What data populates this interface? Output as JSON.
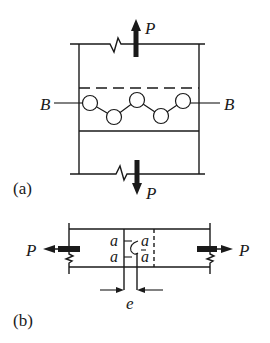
{
  "figure": {
    "part_a": {
      "caption": "(a)",
      "top_force_label": "P",
      "bottom_force_label": "P",
      "left_bolt_label": "B",
      "right_bolt_label": "B",
      "bolt_count": 5
    },
    "part_b": {
      "caption": "(b)",
      "left_force_label": "P",
      "right_force_label": "P",
      "plane_labels": [
        "a",
        "a",
        "a",
        "a"
      ],
      "eccentricity_label": "e"
    },
    "colors": {
      "ink": "#1a1a1a",
      "background": "#ffffff"
    }
  }
}
